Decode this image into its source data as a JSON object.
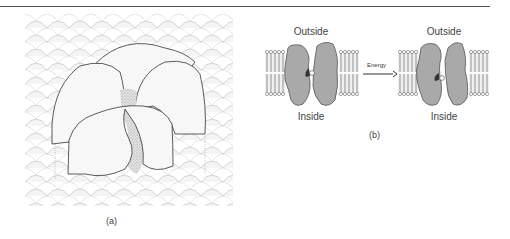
{
  "figure": {
    "panel_a": {
      "label": "(a)",
      "description": "stippled protein complex embedded in lipid bilayer surface"
    },
    "panel_b": {
      "label": "(b)",
      "left_diagram": {
        "top_label": "Outside",
        "bottom_label": "Inside"
      },
      "right_diagram": {
        "top_label": "Outside",
        "bottom_label": "Inside"
      },
      "arrow_label": "Energy"
    }
  },
  "colors": {
    "protein_fill": "#a9a9a9",
    "protein_stroke": "#555555",
    "lipid": "#666666",
    "rule": "#555555"
  }
}
